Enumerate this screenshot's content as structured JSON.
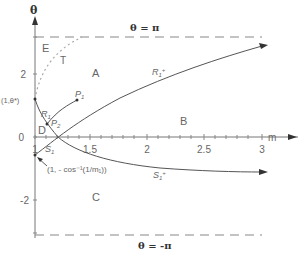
{
  "diagram": {
    "axes": {
      "x_label": "m",
      "y_label": "θ",
      "x_ticks": [
        "1",
        "1.5",
        "2",
        "2.5",
        "3"
      ],
      "y_ticks": [
        "2",
        "0",
        "-2"
      ]
    },
    "boundaries": {
      "top": "θ = π",
      "bottom": "θ = -π"
    },
    "regions": {
      "A": "A",
      "B": "B",
      "C": "C",
      "D": "D",
      "E": "E"
    },
    "curves": {
      "T": "T",
      "R1": "R",
      "R1_sub": "1",
      "R1plus": "R",
      "R1plus_sub": "1",
      "R1plus_sup": "+",
      "S1": "S",
      "S1_sub": "1",
      "S1plus": "S",
      "S1plus_sub": "1",
      "S1plus_sup": "+"
    },
    "points": {
      "P1": "P",
      "P1_sub": "1",
      "P2": "P",
      "P2_sub": "2",
      "theta_star": "(1,θ*)",
      "cos_label": "(1, - cos⁻¹(1/m₁))"
    }
  }
}
